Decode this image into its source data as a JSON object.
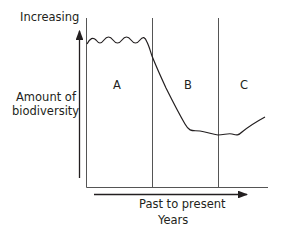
{
  "diagram": {
    "y_axis": {
      "top_label": "Increasing",
      "label_line1": "Amount of",
      "label_line2": "biodiversity"
    },
    "x_axis": {
      "label": "Past to present",
      "unit": "Years"
    },
    "regions": [
      {
        "label": "A"
      },
      {
        "label": "B"
      },
      {
        "label": "C"
      }
    ],
    "colors": {
      "line": "#231f20",
      "frame": "#555555",
      "background": "#ffffff"
    }
  }
}
